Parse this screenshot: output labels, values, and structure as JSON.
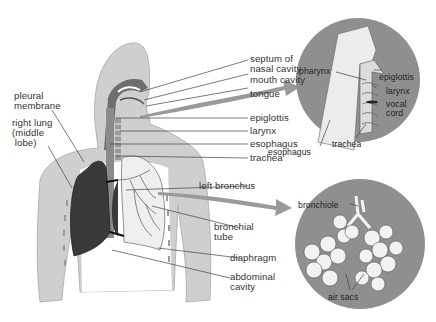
{
  "diagram": {
    "colors": {
      "background": "#ffffff",
      "body": "#cfcfcf",
      "body_outline": "#a8a8a8",
      "lung_dark": "#3a3a3a",
      "lung_light": "#efefef",
      "inset_circle": "#8f8f8f",
      "arrow": "#9a9a9a",
      "label_text": "#333333",
      "leader_line": "#444444"
    },
    "main_labels": {
      "septum": "septum of\nnasal cavity",
      "mouth_cavity": "mouth cavity",
      "tongue": "tongue",
      "epiglottis": "epiglottis",
      "larynx": "larynx",
      "esophagus": "esophagus",
      "trachea": "trachea",
      "left_bronchus": "left bronchus",
      "bronchial_tube": "bronchial\ntube",
      "diaphragm": "diaphragm",
      "abdominal_cavity": "abdominal\ncavity",
      "pleural_membrane": "pleural\nmembrane",
      "right_lung": "right lung\n(middle\n lobe)"
    },
    "inset_throat": {
      "pharynx": "pharynx",
      "epiglottis": "epiglottis",
      "larynx": "larynx",
      "vocal_cord": "vocal\ncord",
      "esophagus": "esophagus",
      "trachea": "trachea"
    },
    "inset_lung": {
      "bronchiole": "bronchiole",
      "air_sacs": "air sacs"
    }
  }
}
